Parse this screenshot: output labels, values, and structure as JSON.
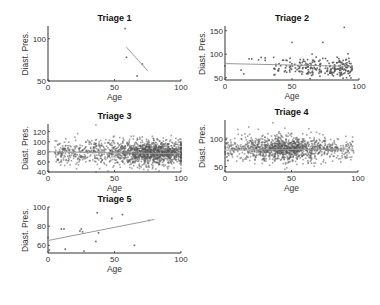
{
  "chart_data": [
    {
      "type": "scatter",
      "title": "Triage 1",
      "xlabel": "Age",
      "ylabel": "Diast. Pres.",
      "xlim": [
        0,
        100
      ],
      "ylim": [
        50,
        115
      ],
      "xticks": [
        0,
        50,
        100
      ],
      "yticks": [
        50,
        100
      ],
      "points": [
        [
          58,
          112
        ],
        [
          59,
          78
        ],
        [
          71,
          70
        ],
        [
          67,
          56
        ]
      ],
      "fit_line": [
        [
          59,
          90
        ],
        [
          75,
          62
        ]
      ],
      "grid": false
    },
    {
      "type": "scatter",
      "title": "Triage 2",
      "xlabel": "Age",
      "ylabel": "Diast. Pres.",
      "xlim": [
        0,
        100
      ],
      "ylim": [
        45,
        160
      ],
      "xticks": [
        0,
        50,
        100
      ],
      "yticks": [
        50,
        100,
        150
      ],
      "n_points_approx": 250,
      "points_sample": [
        [
          0,
          75
        ],
        [
          12,
          66
        ],
        [
          14,
          58
        ],
        [
          18,
          90
        ],
        [
          20,
          90
        ],
        [
          25,
          88
        ],
        [
          27,
          93
        ],
        [
          30,
          92
        ],
        [
          30,
          87
        ],
        [
          38,
          75
        ],
        [
          40,
          65
        ],
        [
          45,
          65
        ],
        [
          50,
          125
        ],
        [
          89,
          157
        ],
        [
          73,
          125
        ],
        [
          65,
          100
        ],
        [
          70,
          85
        ],
        [
          75,
          70
        ],
        [
          80,
          60
        ],
        [
          85,
          75
        ],
        [
          90,
          80
        ],
        [
          93,
          60
        ]
      ],
      "fit_line": [
        [
          0,
          80
        ],
        [
          95,
          74
        ]
      ],
      "grid": false
    },
    {
      "type": "scatter",
      "title": "Triage 3",
      "xlabel": "Age",
      "ylabel": "Diast. Pres.",
      "xlim": [
        0,
        100
      ],
      "ylim": [
        40,
        135
      ],
      "xticks": [
        0,
        50,
        100
      ],
      "yticks": [
        40,
        60,
        80,
        100,
        120
      ],
      "n_points_approx": 1500,
      "cluster": {
        "x_range": [
          5,
          100
        ],
        "y_center": 78,
        "y_spread": 15,
        "density_peak_x": 78
      },
      "outliers": [
        [
          36,
          133
        ],
        [
          72,
          45
        ]
      ],
      "fit_line": [
        [
          0,
          80
        ],
        [
          100,
          76
        ]
      ],
      "grid": false
    },
    {
      "type": "scatter",
      "title": "Triage 4",
      "xlabel": "Age",
      "ylabel": "Diast. Pres.",
      "xlim": [
        0,
        100
      ],
      "ylim": [
        40,
        135
      ],
      "xticks": [
        0,
        50,
        100
      ],
      "yticks": [
        50,
        100
      ],
      "n_points_approx": 1200,
      "cluster": {
        "x_range": [
          0,
          97
        ],
        "y_center": 82,
        "y_spread": 14,
        "density_peak_x": 45
      },
      "outliers": [
        [
          36,
          130
        ],
        [
          25,
          118
        ],
        [
          45,
          120
        ],
        [
          45,
          45
        ]
      ],
      "fit_line": [
        [
          0,
          80
        ],
        [
          95,
          82
        ]
      ],
      "grid": false
    },
    {
      "type": "scatter",
      "title": "Triage 5",
      "xlabel": "Age",
      "ylabel": "Diast. Pres.",
      "xlim": [
        0,
        100
      ],
      "ylim": [
        52,
        100
      ],
      "xticks": [
        0,
        50,
        100
      ],
      "yticks": [
        60,
        80,
        100
      ],
      "points": [
        [
          0,
          68
        ],
        [
          1,
          55
        ],
        [
          10,
          77
        ],
        [
          12,
          77
        ],
        [
          13,
          56
        ],
        [
          24,
          75
        ],
        [
          25,
          77
        ],
        [
          26,
          74
        ],
        [
          27,
          54
        ],
        [
          36,
          64
        ],
        [
          37,
          94
        ],
        [
          38,
          73
        ],
        [
          48,
          88
        ],
        [
          56,
          92
        ],
        [
          65,
          60
        ],
        [
          76,
          86
        ]
      ],
      "fit_line": [
        [
          0,
          65
        ],
        [
          80,
          87
        ]
      ],
      "grid": false
    }
  ]
}
